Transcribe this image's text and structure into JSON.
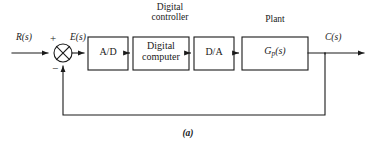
{
  "figure": {
    "caption": "(a)",
    "type": "digital-control-block-diagram"
  },
  "colors": {
    "background": "#ffffff",
    "line": "#1a1a1a",
    "text": "#1a1a1a",
    "box_fill": "#ffffff"
  },
  "group_labels": {
    "digital_controller": "Digital\ncontroller",
    "digital_controller_line1": "Digital",
    "digital_controller_line2": "controller",
    "plant": "Plant"
  },
  "blocks": [
    {
      "id": "ad",
      "label": "A/D",
      "x": 88,
      "y": 37,
      "w": 40,
      "h": 33
    },
    {
      "id": "digital-computer",
      "label": "Digital computer",
      "line1": "Digital",
      "line2": "computer",
      "x": 133,
      "y": 37,
      "w": 56,
      "h": 33
    },
    {
      "id": "da",
      "label": "D/A",
      "x": 194,
      "y": 37,
      "w": 40,
      "h": 33
    },
    {
      "id": "plant",
      "label": "Gp(s)",
      "base": "G",
      "subscript": "p",
      "suffix": "(s)",
      "x": 242,
      "y": 37,
      "w": 66,
      "h": 33
    }
  ],
  "summing_junction": {
    "id": "summing-junction",
    "cx": 63,
    "cy": 53,
    "r": 9,
    "plus_sign": "+",
    "minus_sign": "−",
    "style": "circle-with-cross"
  },
  "signals": {
    "input": "R(s)",
    "error": "E(s)",
    "output": "C(s)"
  },
  "connections": [
    {
      "from": "input-source",
      "to": "summing-junction",
      "label": "R(s)"
    },
    {
      "from": "summing-junction",
      "to": "ad",
      "label": "E(s)"
    },
    {
      "from": "ad",
      "to": "digital-computer",
      "label": ""
    },
    {
      "from": "digital-computer",
      "to": "da",
      "label": ""
    },
    {
      "from": "da",
      "to": "plant",
      "label": ""
    },
    {
      "from": "plant",
      "to": "output-sink",
      "label": "C(s)"
    },
    {
      "from": "output-tap",
      "to": "summing-junction",
      "label": "feedback"
    }
  ]
}
